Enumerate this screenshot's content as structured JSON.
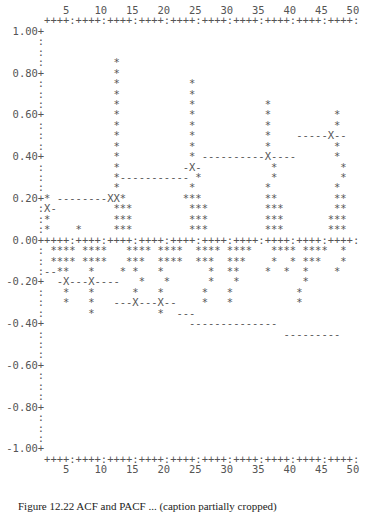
{
  "chart_data": {
    "type": "bar",
    "xlabel": "Lag",
    "ylabel": "",
    "x_ticks": [
      5,
      10,
      15,
      20,
      25,
      30,
      35,
      40,
      45,
      50
    ],
    "y_ticks": [
      "1.00",
      "0.80",
      "0.60",
      "0.40",
      "0.20",
      "0.00",
      "-0.20",
      "-0.40",
      "-0.60",
      "-0.80",
      "-1.00"
    ],
    "ylim": [
      -1.0,
      1.0
    ],
    "xlim": [
      1,
      50
    ],
    "grid": false,
    "series": [
      {
        "name": "spikes",
        "points": [
          {
            "x": 1,
            "y": 0.2
          },
          {
            "x": 2,
            "y": 0.15
          },
          {
            "x": 3,
            "y": -0.1
          },
          {
            "x": 6,
            "y": 0.05
          },
          {
            "x": 12,
            "y": 0.2
          },
          {
            "x": 13,
            "y": 0.85
          },
          {
            "x": 14,
            "y": 0.2
          },
          {
            "x": 24,
            "y": 0.2
          },
          {
            "x": 25,
            "y": 0.75
          },
          {
            "x": 26,
            "y": 0.2
          },
          {
            "x": 36,
            "y": 0.15
          },
          {
            "x": 37,
            "y": 0.65
          },
          {
            "x": 38,
            "y": 0.15
          },
          {
            "x": 47,
            "y": 0.1
          },
          {
            "x": 48,
            "y": 0.6
          },
          {
            "x": 49,
            "y": 0.15
          },
          {
            "x": 4,
            "y": -0.15
          },
          {
            "x": 7,
            "y": -0.2
          },
          {
            "x": 9,
            "y": -0.15
          },
          {
            "x": 10,
            "y": -0.3
          },
          {
            "x": 16,
            "y": -0.2
          },
          {
            "x": 19,
            "y": -0.25
          },
          {
            "x": 21,
            "y": -0.3
          },
          {
            "x": 30,
            "y": -0.15
          },
          {
            "x": 33,
            "y": -0.25
          },
          {
            "x": 43,
            "y": -0.3
          },
          {
            "x": 50,
            "y": -0.15
          }
        ]
      },
      {
        "name": "upper_limit",
        "segments": [
          {
            "x0": 1,
            "x1": 12,
            "y": 0.2
          },
          {
            "x0": 14,
            "x1": 23,
            "y": 0.3
          },
          {
            "x0": 26,
            "x1": 41,
            "y": 0.4
          },
          {
            "x0": 42,
            "x1": 50,
            "y": 0.45
          }
        ]
      },
      {
        "name": "lower_limit",
        "segments": [
          {
            "x0": 1,
            "x1": 4,
            "y": -0.1
          },
          {
            "x0": 4,
            "x1": 12,
            "y": -0.2
          },
          {
            "x0": 14,
            "x1": 22,
            "y": -0.3
          },
          {
            "x0": 23,
            "x1": 25,
            "y": -0.35
          },
          {
            "x0": 26,
            "x1": 41,
            "y": -0.4
          },
          {
            "x0": 42,
            "x1": 50,
            "y": -0.45
          }
        ]
      }
    ]
  },
  "plot": {
    "lines": [
      "          5    10   15   20   25   30   35   40   45   50",
      "       ++++:++++:++++:++++:++++:++++:++++:++++:++++:++++:",
      "  1.00+",
      "      :",
      "      :",
      "      :           *",
      "  0.80+           *",
      "      :           *           *",
      "      :           *           *",
      "      :           *           *           *",
      "  0.60+           *           *           *          *",
      "      :           *           *           *          *",
      "      :           *           *           *    -----X--",
      "      :           *           *           *          *",
      "  0.40+           *           * ----------X----      *",
      "      :           *          -X-           *          *",
      "      :           *----------- *           *          *",
      "      :           *           *           *          *",
      "  0.20+* --------XX*         ***          **         **",
      "      :X-         ***         ***         ***        **",
      "      :*          ***         ***         ***       ***",
      "      :*    *     ***         ***         ***       ***",
      "  0.00+++++:++++:++++:++++:++++:++++:++++:++++:++++:++++:",
      "      : **** ****   **** ****  **** ****   **** ****  *",
      "      : **** ****   ***  ****  ***  ***    *  * ***   *",
      "      :--**   *    * *   *       *  **    *  *  *    *",
      " -0.20+  -X---X----   *   *      *   *          *",
      "      :   *   *      *   *      *   *          *",
      "      :   *   *   ---X---X--    *   *          *",
      "      :       *          *  ---",
      " -0.40+                       --------------",
      "      :                                      ---------",
      "      :",
      "      :",
      " -0.60+",
      "      :",
      "      :",
      "      :",
      " -0.80+",
      "      :",
      "      :",
      "      :",
      " -1.00+",
      "       ++++:++++:++++:++++:++++:++++:++++:++++:++++:++++:",
      "          5    10   15   20   25   30   35   40   45   50"
    ]
  },
  "caption": "Figure 12.22  ACF and PACF ... (caption partially cropped)"
}
